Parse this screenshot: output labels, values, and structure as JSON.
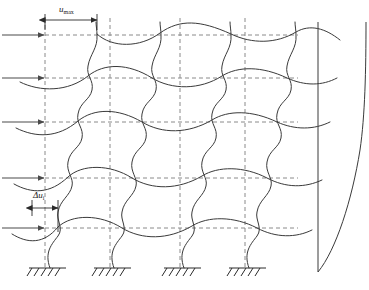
{
  "figure": {
    "width": 369,
    "height": 290,
    "background_color": "#ffffff",
    "line_color": "#3a3a3a",
    "dashed_color": "#8a8a8a",
    "arrow_color": "#4a4a4a"
  },
  "labels": {
    "u_max": {
      "symbol": "u",
      "subscript": "max",
      "text": "umax"
    },
    "delta_u_i": {
      "symbol": "Δu",
      "subscript": "i",
      "text": "Δui"
    }
  },
  "grid": {
    "column_x": [
      45,
      110,
      180,
      245
    ],
    "row_y": [
      35,
      78,
      122,
      178,
      228
    ],
    "ground_y": 268
  },
  "load_arrows": {
    "count": 5,
    "y_positions": [
      35,
      78,
      122,
      178,
      228
    ],
    "x_start": 2,
    "x_end": 45,
    "direction": "right"
  },
  "supports": {
    "count": 4,
    "type": "fixed",
    "x_positions": [
      45,
      110,
      180,
      245
    ],
    "y": 268
  },
  "dimension_umax": {
    "x_start": 45,
    "x_end": 97,
    "y": 20
  },
  "dimension_delta_u": {
    "x_start": 32,
    "x_end": 58,
    "y": 208
  },
  "deflection_profile": {
    "reference_line_x": 318,
    "top_y": 22,
    "base_y": 272,
    "max_offset_x": 366,
    "shape": "cantilever-shear-bending"
  },
  "frame": {
    "storeys": 5,
    "bays": 3,
    "deformed_style": "solid-curved",
    "undeformed_style": "dashed-orthogonal"
  }
}
